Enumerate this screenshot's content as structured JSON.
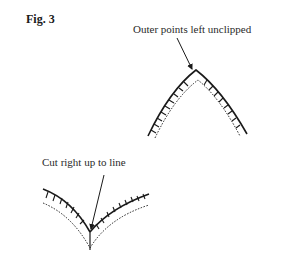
{
  "figure": {
    "title": "Fig. 3"
  },
  "annotations": {
    "outer_points": "Outer points left unclipped",
    "cut_line": "Cut right up to line"
  },
  "diagrams": [
    {
      "name": "convex-curve",
      "description": "Outer (convex) curve with clip marks; points left unclipped"
    },
    {
      "name": "concave-curve",
      "description": "Inner (concave) curve with clip marks; cut right up to line"
    }
  ],
  "colors": {
    "stroke": "#1a1a1a",
    "background": "#ffffff"
  }
}
